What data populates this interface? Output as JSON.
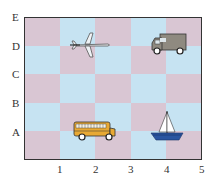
{
  "grid": {
    "rows": 5,
    "cols": 5,
    "colors": {
      "pink": "#d9c6d3",
      "blue": "#c6e3f2",
      "border": "#333333"
    },
    "pattern": [
      [
        "pink",
        "blue",
        "pink",
        "blue",
        "pink"
      ],
      [
        "blue",
        "pink",
        "blue",
        "pink",
        "blue"
      ],
      [
        "pink",
        "blue",
        "pink",
        "blue",
        "pink"
      ],
      [
        "blue",
        "pink",
        "blue",
        "pink",
        "blue"
      ],
      [
        "pink",
        "blue",
        "pink",
        "blue",
        "pink"
      ]
    ]
  },
  "axes": {
    "x_labels": [
      "1",
      "2",
      "3",
      "4",
      "5"
    ],
    "y_labels": [
      "E",
      "D",
      "C",
      "B",
      "A"
    ]
  },
  "objects": [
    {
      "name": "airplane",
      "icon": "airplane-icon",
      "position": "(2, D)"
    },
    {
      "name": "truck",
      "icon": "truck-icon",
      "position": "(4, D)"
    },
    {
      "name": "school bus",
      "icon": "bus-icon",
      "position": "(2, A)"
    },
    {
      "name": "sailboat",
      "icon": "sailboat-icon",
      "position": "(4, A)"
    }
  ]
}
